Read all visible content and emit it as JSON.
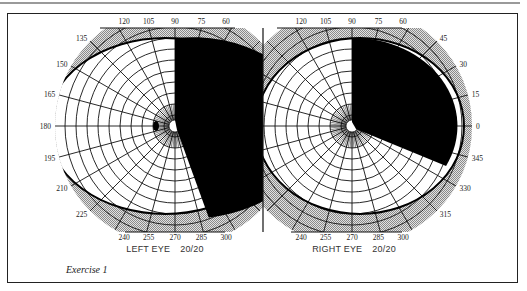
{
  "figure": {
    "caption": "Exercise 1",
    "colors": {
      "ink": "#111111",
      "band": "#c8c8c8",
      "paper": "#ffffff",
      "frame": "#222222"
    }
  },
  "chart_data": [
    {
      "type": "polar-visual-field",
      "title": "LEFT EYE 20/20",
      "eye": "left",
      "label": "LEFT EYE",
      "acuity": "20/20",
      "angle_tick_labels": [
        "120",
        "105",
        "90",
        "75",
        "60",
        "135",
        "150",
        "165",
        "180",
        "195",
        "210",
        "225",
        "240",
        "255",
        "270",
        "285",
        "300"
      ],
      "defect": {
        "kind": "right homonymous hemianopia (temporal/nasal black sector)",
        "from_deg": 270,
        "to_deg": 450,
        "description": "black half-field from 90° clockwise through 0° to ~290°"
      },
      "blind_spot": {
        "angle_deg": 180,
        "eccentricity_fraction": 0.18
      },
      "isopter": "elliptical boundary, wider temporally (toward 180°)"
    },
    {
      "type": "polar-visual-field",
      "title": "RIGHT EYE 20/20",
      "eye": "right",
      "label": "RIGHT EYE",
      "acuity": "20/20",
      "angle_tick_labels": [
        "120",
        "105",
        "90",
        "75",
        "60",
        "45",
        "30",
        "15",
        "0",
        "345",
        "330",
        "315",
        "240",
        "255",
        "270",
        "285",
        "300"
      ],
      "defect": {
        "kind": "black sector",
        "from_deg": 330,
        "to_deg": 450,
        "description": "black region from 90° clockwise to ~330°"
      },
      "isopter": "elliptical boundary, wider temporally (toward 0°)"
    }
  ]
}
